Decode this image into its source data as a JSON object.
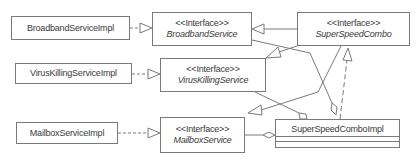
{
  "diagram": {
    "type": "uml-class-diagram",
    "line_color": "#7a7a7a",
    "text_color": "#3a3a3a",
    "classes": [
      {
        "id": "broadband_impl",
        "name": "BroadbandServiceImpl"
      },
      {
        "id": "virus_impl",
        "name": "VirusKillingServiceImpl"
      },
      {
        "id": "mailbox_impl",
        "name": "MailboxServiceImpl"
      },
      {
        "id": "combo_impl",
        "name": "SuperSpeedComboImpl"
      }
    ],
    "interfaces": [
      {
        "id": "broadband",
        "stereotype": "<<Interface>>",
        "name": "BroadbandService"
      },
      {
        "id": "virus",
        "stereotype": "<<Interface>>",
        "name": "VirusKillingService"
      },
      {
        "id": "mailbox",
        "stereotype": "<<Interface>>",
        "name": "MailboxService"
      },
      {
        "id": "combo",
        "stereotype": "<<Interface>>",
        "name": "SuperSpeedCombo"
      }
    ],
    "relations": [
      {
        "from": "BroadbandServiceImpl",
        "to": "BroadbandService",
        "kind": "realization"
      },
      {
        "from": "VirusKillingServiceImpl",
        "to": "VirusKillingService",
        "kind": "realization"
      },
      {
        "from": "MailboxServiceImpl",
        "to": "MailboxService",
        "kind": "realization"
      },
      {
        "from": "SuperSpeedCombo",
        "to": "BroadbandService",
        "kind": "generalization"
      },
      {
        "from": "SuperSpeedCombo",
        "to": "VirusKillingService",
        "kind": "generalization"
      },
      {
        "from": "SuperSpeedCombo",
        "to": "MailboxService",
        "kind": "generalization"
      },
      {
        "from": "SuperSpeedComboImpl",
        "to": "SuperSpeedCombo",
        "kind": "realization"
      },
      {
        "from": "SuperSpeedComboImpl",
        "to": "BroadbandService",
        "kind": "aggregation"
      },
      {
        "from": "SuperSpeedComboImpl",
        "to": "VirusKillingService",
        "kind": "aggregation"
      },
      {
        "from": "SuperSpeedComboImpl",
        "to": "MailboxService",
        "kind": "aggregation"
      }
    ]
  }
}
